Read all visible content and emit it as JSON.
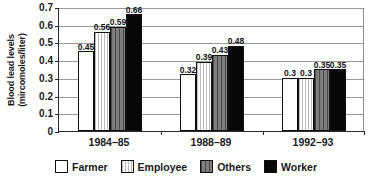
{
  "chart_data": {
    "type": "bar",
    "title": "",
    "subtitle": "",
    "xlabel": "",
    "ylabel": "Blood lead levels (mircomoles/liter)",
    "ylabel_lines": [
      "Blood lead levels",
      "(mircomoles/liter)"
    ],
    "categories": [
      "1984–85",
      "1988–89",
      "1992–93"
    ],
    "series": [
      {
        "name": "Farmer",
        "values": [
          0.45,
          0.32,
          0.3
        ],
        "labels": [
          "0.45",
          "0.32",
          "0.3"
        ],
        "swatch": "white-square"
      },
      {
        "name": "Employee",
        "values": [
          0.56,
          0.39,
          0.3
        ],
        "labels": [
          "0.56",
          "0.39",
          "0.3"
        ],
        "swatch": "light-vertical-stripes-square"
      },
      {
        "name": "Others",
        "values": [
          0.59,
          0.43,
          0.35
        ],
        "labels": [
          "0.59",
          "0.43",
          "0.35"
        ],
        "swatch": "dark-gray-vertical-stripes-square"
      },
      {
        "name": "Worker",
        "values": [
          0.66,
          0.48,
          0.35
        ],
        "labels": [
          "0.66",
          "0.48",
          "0.35"
        ],
        "swatch": "black-square"
      }
    ],
    "ylim": [
      0,
      0.7
    ],
    "ytick_values": [
      0,
      0.1,
      0.2,
      0.3,
      0.4,
      0.5,
      0.6,
      0.7
    ],
    "ytick_labels": [
      "0",
      "0.1",
      "0.2",
      "0.3",
      "0.4",
      "0.5",
      "0.6",
      "0.7"
    ],
    "grid": true,
    "grid_axis": "y",
    "legend_position": "bottom",
    "data_labels": true,
    "colors": {
      "farmer": "#ffffff",
      "employee": "#e0e0e0",
      "others": "#757575",
      "worker": "#070707",
      "axis": "#2b2b2b",
      "grid": "#9a9a9a",
      "text": "#1a1a1a"
    }
  },
  "legend": {
    "items": [
      {
        "label": "Farmer"
      },
      {
        "label": "Employee"
      },
      {
        "label": "Others"
      },
      {
        "label": "Worker"
      }
    ]
  }
}
